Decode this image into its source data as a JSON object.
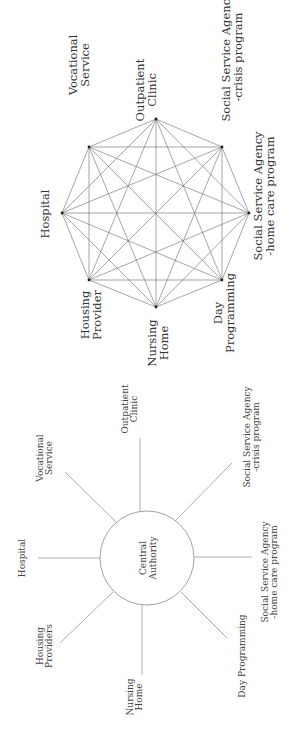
{
  "network_diagram": {
    "layout": "fully-connected octagon",
    "nodes": [
      {
        "id": "outpatient",
        "label_lines": [
          "Outpatient",
          "Clinic"
        ]
      },
      {
        "id": "vocational",
        "label_lines": [
          "Vocational",
          "Service"
        ]
      },
      {
        "id": "hospital",
        "label_lines": [
          "Hospital"
        ]
      },
      {
        "id": "housing",
        "label_lines": [
          "Housing",
          "Provider"
        ]
      },
      {
        "id": "nursing",
        "label_lines": [
          "Nursing",
          "Home"
        ]
      },
      {
        "id": "day",
        "label_lines": [
          "Day",
          "Programming"
        ]
      },
      {
        "id": "ssa_home",
        "label_lines": [
          "Social Service Agency",
          "-home care program"
        ]
      },
      {
        "id": "ssa_crisis",
        "label_lines": [
          "Social Service Agency",
          "-crisis program"
        ]
      }
    ]
  },
  "hub_diagram": {
    "layout": "hub-and-spoke",
    "center_lines": [
      "Central",
      "Authority"
    ],
    "spokes": [
      {
        "id": "outpatient",
        "label_lines": [
          "Outpatient",
          "Clinic"
        ]
      },
      {
        "id": "vocational",
        "label_lines": [
          "Vocational",
          "Service"
        ]
      },
      {
        "id": "hospital",
        "label_lines": [
          "Hospital"
        ]
      },
      {
        "id": "housing",
        "label_lines": [
          "Housing",
          "Providers"
        ]
      },
      {
        "id": "nursing",
        "label_lines": [
          "Nursing",
          "Home"
        ]
      },
      {
        "id": "day",
        "label_lines": [
          "Day Programming"
        ]
      },
      {
        "id": "ssa_home",
        "label_lines": [
          "Social Service Agency",
          "-home care program"
        ]
      },
      {
        "id": "ssa_crisis",
        "label_lines": [
          "Social Service Agency",
          "-crisis program"
        ]
      }
    ]
  }
}
